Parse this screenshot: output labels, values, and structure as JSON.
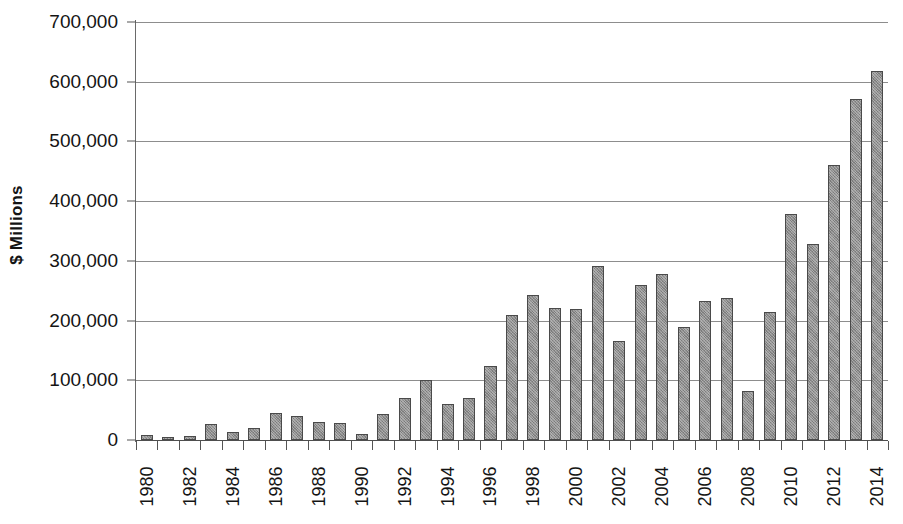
{
  "chart_data": {
    "type": "bar",
    "title": "",
    "xlabel": "",
    "ylabel": "$ Millions",
    "ylim": [
      0,
      700000
    ],
    "ytick_step": 100000,
    "grid": true,
    "legend": "none",
    "bar_color": "#8e8e8e",
    "bar_border_color": "#4a4a4a",
    "gridline_color": "#8d8d8d",
    "axis_color": "#4e4e4e",
    "ytick_labels": [
      "700,000",
      "600,000",
      "500,000",
      "400,000",
      "300,000",
      "200,000",
      "100,000",
      "0"
    ],
    "ytick_values": [
      700000,
      600000,
      500000,
      400000,
      300000,
      200000,
      100000,
      0
    ],
    "categories": [
      "1980",
      "1981",
      "1982",
      "1983",
      "1984",
      "1985",
      "1986",
      "1987",
      "1988",
      "1989",
      "1990",
      "1991",
      "1992",
      "1993",
      "1994",
      "1995",
      "1996",
      "1997",
      "1998",
      "1999",
      "2000",
      "2001",
      "2002",
      "2003",
      "2004",
      "2005",
      "2006",
      "2007",
      "2008",
      "2009",
      "2010",
      "2011",
      "2012",
      "2013",
      "2014"
    ],
    "xtick_labels_shown": [
      "1980",
      "1982",
      "1984",
      "1986",
      "1988",
      "1990",
      "1992",
      "1994",
      "1996",
      "1998",
      "2000",
      "2002",
      "2004",
      "2006",
      "2008",
      "2010",
      "2012",
      "2014"
    ],
    "values": [
      9000,
      5000,
      7000,
      26000,
      13000,
      20000,
      45000,
      41000,
      31000,
      28000,
      10000,
      43000,
      71000,
      101000,
      61000,
      71000,
      124000,
      209000,
      243000,
      221000,
      220000,
      292000,
      166000,
      259000,
      278000,
      189000,
      232000,
      237000,
      82000,
      215000,
      378000,
      328000,
      461000,
      571000,
      618000
    ]
  }
}
